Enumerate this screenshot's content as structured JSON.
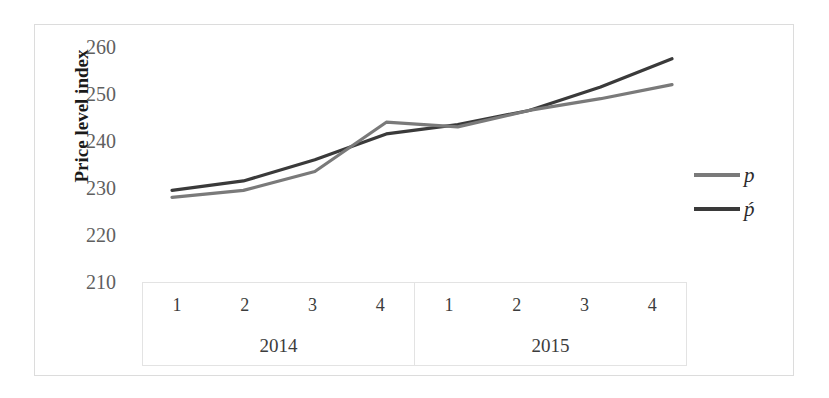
{
  "chart_data": {
    "type": "line",
    "title": "",
    "subtitle": "",
    "xlabel": "",
    "ylabel": "Price level index",
    "ylim": [
      210,
      260
    ],
    "yticks": [
      260,
      250,
      240,
      230,
      220,
      210
    ],
    "grid": false,
    "legend_position": "right",
    "x": [
      "1",
      "2",
      "3",
      "4",
      "1",
      "2",
      "3",
      "4"
    ],
    "x_groups": [
      {
        "label": "2014",
        "quarters": [
          "1",
          "2",
          "3",
          "4"
        ]
      },
      {
        "label": "2015",
        "quarters": [
          "1",
          "2",
          "3",
          "4"
        ]
      }
    ],
    "series": [
      {
        "name": "p",
        "color": "#7a7a7a",
        "values": [
          228.0,
          229.5,
          233.5,
          244.0,
          243.0,
          246.5,
          249.0,
          252.0
        ]
      },
      {
        "name": "ṕ",
        "color": "#3a3a3a",
        "values": [
          229.5,
          231.5,
          236.0,
          241.5,
          243.5,
          246.5,
          251.5,
          257.5
        ]
      }
    ]
  },
  "axis": {
    "y_title": "Price level index",
    "y_tick_0": "260",
    "y_tick_1": "250",
    "y_tick_2": "240",
    "y_tick_3": "230",
    "y_tick_4": "220",
    "y_tick_5": "210"
  },
  "x_axis": {
    "groups": [
      {
        "year": "2014",
        "q0": "1",
        "q1": "2",
        "q2": "3",
        "q3": "4"
      },
      {
        "year": "2015",
        "q0": "1",
        "q1": "2",
        "q2": "3",
        "q3": "4"
      }
    ]
  },
  "legend": {
    "item_0_label": "p",
    "item_1_label": "ṕ",
    "item_0_color": "#7a7a7a",
    "item_1_color": "#3a3a3a"
  },
  "colors": {
    "series_p": "#7a7a7a",
    "series_p_prime": "#3a3a3a",
    "frame": "#dcdcdc",
    "tick_text": "#5f5f5f",
    "axis_text": "#3c3c3c",
    "background": "#ffffff"
  }
}
